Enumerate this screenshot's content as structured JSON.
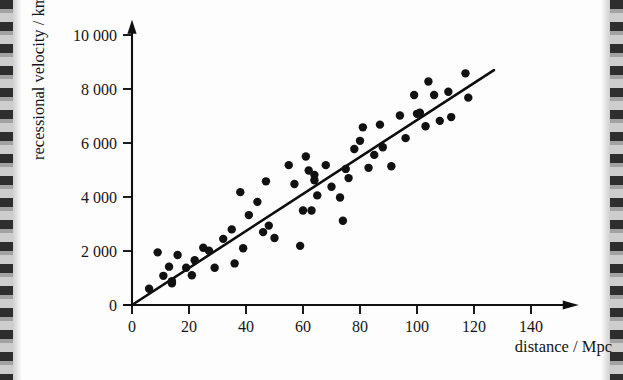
{
  "figure": {
    "name": "hubble-diagram",
    "background_color": "#fdfdfd",
    "ink_color": "#111111"
  },
  "chart_data": {
    "type": "scatter",
    "title": "",
    "subtitle": "",
    "xlabel": "distance / Mpc",
    "ylabel": "recessional velocity / km s",
    "ylabel_exponent": "-1",
    "xlim": [
      0,
      155
    ],
    "ylim": [
      0,
      10600
    ],
    "grid": false,
    "legend": null,
    "x_ticks": [
      0,
      20,
      40,
      60,
      80,
      100,
      120,
      140
    ],
    "x_tick_labels": [
      "0",
      "20",
      "40",
      "60",
      "80",
      "100",
      "120",
      "140"
    ],
    "y_ticks": [
      0,
      2000,
      4000,
      6000,
      8000,
      10000
    ],
    "y_tick_labels": [
      "0",
      "2 000",
      "4 000",
      "6 000",
      "8 000",
      "10 000"
    ],
    "series": [
      {
        "name": "galaxies",
        "marker": "filled-circle",
        "marker_color": "#111111",
        "marker_size": 4.2,
        "points": [
          [
            6,
            600
          ],
          [
            9,
            1950
          ],
          [
            11,
            1080
          ],
          [
            13,
            1420
          ],
          [
            14,
            800
          ],
          [
            14,
            880
          ],
          [
            16,
            1850
          ],
          [
            19,
            1380
          ],
          [
            21,
            1100
          ],
          [
            22,
            1660
          ],
          [
            25,
            2120
          ],
          [
            27,
            2010
          ],
          [
            29,
            1380
          ],
          [
            32,
            2450
          ],
          [
            35,
            2800
          ],
          [
            36,
            1540
          ],
          [
            38,
            4180
          ],
          [
            39,
            2100
          ],
          [
            41,
            3330
          ],
          [
            44,
            3820
          ],
          [
            46,
            2700
          ],
          [
            47,
            4580
          ],
          [
            48,
            2940
          ],
          [
            50,
            2480
          ],
          [
            55,
            5180
          ],
          [
            57,
            4480
          ],
          [
            59,
            2190
          ],
          [
            60,
            3500
          ],
          [
            61,
            5500
          ],
          [
            62,
            4980
          ],
          [
            63,
            3500
          ],
          [
            64,
            4620
          ],
          [
            64,
            4820
          ],
          [
            65,
            4060
          ],
          [
            68,
            5180
          ],
          [
            70,
            4380
          ],
          [
            73,
            3980
          ],
          [
            74,
            3120
          ],
          [
            75,
            5040
          ],
          [
            76,
            4700
          ],
          [
            78,
            5780
          ],
          [
            80,
            6080
          ],
          [
            81,
            6580
          ],
          [
            83,
            5080
          ],
          [
            85,
            5560
          ],
          [
            87,
            6680
          ],
          [
            88,
            5840
          ],
          [
            91,
            5140
          ],
          [
            94,
            7020
          ],
          [
            96,
            6180
          ],
          [
            99,
            7780
          ],
          [
            100,
            7080
          ],
          [
            101,
            7120
          ],
          [
            103,
            6620
          ],
          [
            104,
            8280
          ],
          [
            106,
            7780
          ],
          [
            108,
            6820
          ],
          [
            111,
            7900
          ],
          [
            112,
            6960
          ],
          [
            117,
            8580
          ],
          [
            118,
            7680
          ]
        ]
      }
    ],
    "fit_line": {
      "name": "hubble-law-best-fit",
      "type": "line",
      "through_origin": true,
      "start": [
        0,
        0
      ],
      "end": [
        127,
        8700
      ],
      "slope_km_s_per_Mpc": 68.5
    }
  }
}
